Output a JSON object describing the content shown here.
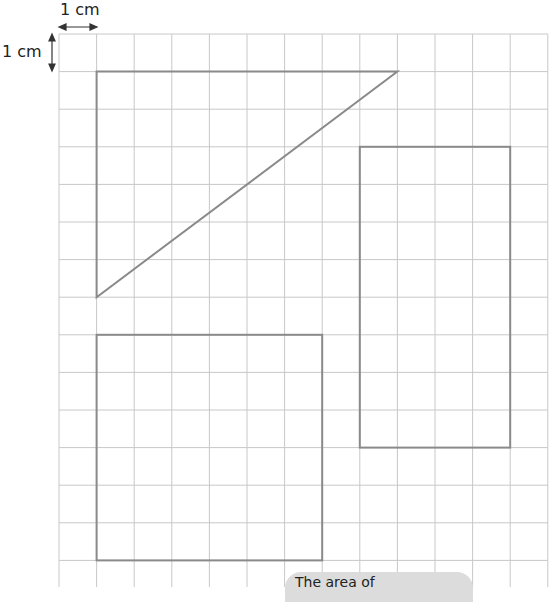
{
  "scale": {
    "horizontal_label": "1 cm",
    "vertical_label": "1 cm"
  },
  "grid": {
    "columns": 13,
    "rows": 15,
    "cell_size_cm": 1,
    "line_color": "#c8c8c8",
    "shape_color": "#8a8a8a"
  },
  "shapes": [
    {
      "name": "right-triangle",
      "type": "polygon",
      "points": [
        [
          1,
          1
        ],
        [
          9,
          1
        ],
        [
          1,
          7
        ]
      ],
      "width_cm": 8,
      "height_cm": 6
    },
    {
      "name": "rectangle",
      "type": "rect",
      "x": 8,
      "y": 3,
      "w": 4,
      "h": 8
    },
    {
      "name": "square",
      "type": "rect",
      "x": 1,
      "y": 8,
      "w": 6,
      "h": 6
    }
  ],
  "callout": {
    "text": "The area of"
  }
}
